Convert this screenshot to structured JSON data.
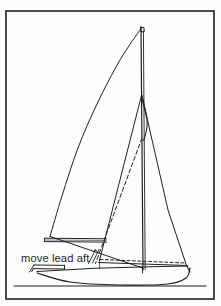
{
  "figure": {
    "kind": "technical-line-drawing",
    "background_color": "#fdfdfb",
    "ink_color": "#231f1d",
    "frame": {
      "label": "figure-border",
      "x": 6,
      "y": 11,
      "width": 208,
      "height": 288,
      "stroke_width": 1.6
    }
  },
  "annotations": {
    "move_lead_aft": {
      "text": "move lead aft",
      "x": 21,
      "y": 262,
      "font_size": 11.2
    }
  },
  "chart_data": {
    "type": "line",
    "xlabel": "",
    "ylabel": "",
    "xlim": [
      0,
      221
    ],
    "ylim": [
      306,
      0
    ],
    "grid": false,
    "legend": "none",
    "annotations": [
      {
        "text": "move lead aft",
        "x": 21,
        "y": 262
      }
    ],
    "series": [
      {
        "name": "mast",
        "style": "solid",
        "stroke_width": 1.2,
        "points": [
          [
            141.0,
            27.0
          ],
          [
            143.0,
            270.0
          ]
        ]
      },
      {
        "name": "mast-aft-face",
        "style": "solid",
        "stroke_width": 0.9,
        "points": [
          [
            143.4,
            31.0
          ],
          [
            145.2,
            269.5
          ]
        ]
      },
      {
        "name": "masthead-cap",
        "style": "solid",
        "stroke_width": 1.0,
        "points": [
          [
            140.6,
            27.2
          ],
          [
            144.0,
            27.6
          ],
          [
            144.2,
            32.0
          ],
          [
            140.8,
            31.6
          ],
          [
            140.6,
            27.2
          ]
        ]
      },
      {
        "name": "mainsail-leech",
        "style": "curve",
        "stroke_width": 1.0,
        "points": [
          [
            141.0,
            28.5
          ],
          [
            120.0,
            60.0
          ],
          [
            97.0,
            104.0
          ],
          [
            78.0,
            148.0
          ],
          [
            62.0,
            196.0
          ],
          [
            50.0,
            236.5
          ]
        ]
      },
      {
        "name": "mainsail-foot-to-tack",
        "style": "solid",
        "stroke_width": 1.0,
        "points": [
          [
            50.0,
            236.5
          ],
          [
            142.8,
            268.0
          ]
        ]
      },
      {
        "name": "boom-top",
        "style": "solid",
        "stroke_width": 1.0,
        "points": [
          [
            44.5,
            238.2
          ],
          [
            106.5,
            238.8
          ]
        ]
      },
      {
        "name": "boom-bottom",
        "style": "solid",
        "stroke_width": 1.0,
        "points": [
          [
            44.5,
            241.6
          ],
          [
            106.6,
            242.1
          ]
        ]
      },
      {
        "name": "boom-end-cap",
        "style": "solid",
        "stroke_width": 1.0,
        "points": [
          [
            44.5,
            238.2
          ],
          [
            44.5,
            241.6
          ]
        ]
      },
      {
        "name": "boom-shade",
        "style": "solid",
        "stroke_width": 0.6,
        "points": [
          [
            45.6,
            240.0
          ],
          [
            106.0,
            240.5
          ]
        ]
      },
      {
        "name": "jib-luff-forestay",
        "style": "solid",
        "stroke_width": 1.0,
        "points": [
          [
            141.6,
            95.0
          ],
          [
            99.0,
            262.5
          ]
        ]
      },
      {
        "name": "jib-leech",
        "style": "solid",
        "stroke_width": 1.0,
        "points": [
          [
            142.2,
            95.5
          ],
          [
            150.0,
            131.0
          ],
          [
            168.0,
            210.0
          ],
          [
            186.5,
            265.5
          ]
        ]
      },
      {
        "name": "jib-upper-leech-hook",
        "style": "curve",
        "stroke_width": 1.1,
        "points": [
          [
            142.0,
            99.0
          ],
          [
            147.0,
            120.0
          ],
          [
            146.2,
            131.5
          ],
          [
            143.6,
            140.5
          ]
        ]
      },
      {
        "name": "jib-foot",
        "style": "solid",
        "stroke_width": 1.0,
        "points": [
          [
            99.0,
            262.5
          ],
          [
            186.5,
            265.5
          ]
        ]
      },
      {
        "name": "sheet-lead-new-dashed",
        "style": "dashed",
        "stroke_width": 1.0,
        "dash": "3,2.4",
        "points": [
          [
            100.0,
            259.5
          ],
          [
            186.0,
            263.0
          ]
        ]
      },
      {
        "name": "jib-luff-alt-dashed",
        "style": "dashed",
        "stroke_width": 1.0,
        "dash": "4,2.6",
        "points": [
          [
            142.0,
            138.0
          ],
          [
            95.5,
            263.5
          ]
        ]
      },
      {
        "name": "lead-arrow-shaft",
        "style": "solid",
        "stroke_width": 0.9,
        "points": [
          [
            88.5,
            263.5
          ],
          [
            95.5,
            250.0
          ]
        ]
      },
      {
        "name": "lead-arrow-shaft-2",
        "style": "solid",
        "stroke_width": 0.9,
        "points": [
          [
            92.5,
            263.0
          ],
          [
            99.0,
            249.5
          ]
        ]
      },
      {
        "name": "lead-arrow-head-1",
        "style": "solid",
        "stroke_width": 0.9,
        "points": [
          [
            93.4,
            251.6
          ],
          [
            95.6,
            249.7
          ],
          [
            97.4,
            252.0
          ]
        ]
      },
      {
        "name": "deck-sheer-line",
        "style": "solid",
        "stroke_width": 1.1,
        "points": [
          [
            37.0,
            271.5
          ],
          [
            95.0,
            268.2
          ],
          [
            150.0,
            266.8
          ],
          [
            188.0,
            266.0
          ]
        ]
      },
      {
        "name": "hull-bottom-profile",
        "style": "curve",
        "stroke_width": 1.2,
        "points": [
          [
            37.0,
            273.0
          ],
          [
            70.0,
            282.0
          ],
          [
            120.0,
            285.0
          ],
          [
            168.0,
            284.0
          ],
          [
            186.0,
            278.0
          ],
          [
            190.0,
            268.0
          ]
        ]
      },
      {
        "name": "waterline",
        "style": "solid",
        "stroke_width": 1.1,
        "points": [
          [
            14.0,
            286.0
          ],
          [
            206.0,
            286.0
          ]
        ]
      },
      {
        "name": "cabin-roof-top",
        "style": "solid",
        "stroke_width": 1.0,
        "points": [
          [
            34.0,
            265.0
          ],
          [
            64.5,
            265.4
          ]
        ]
      },
      {
        "name": "cabin-roof-bottom",
        "style": "solid",
        "stroke_width": 1.0,
        "points": [
          [
            33.4,
            268.6
          ],
          [
            64.6,
            269.0
          ]
        ]
      },
      {
        "name": "cabin-front-slant",
        "style": "solid",
        "stroke_width": 1.0,
        "points": [
          [
            34.0,
            265.0
          ],
          [
            29.4,
            272.0
          ]
        ]
      },
      {
        "name": "cabin-front-slant-inner",
        "style": "solid",
        "stroke_width": 1.0,
        "points": [
          [
            33.4,
            268.6
          ],
          [
            31.8,
            271.6
          ]
        ]
      },
      {
        "name": "cabin-aft-edge",
        "style": "solid",
        "stroke_width": 1.0,
        "points": [
          [
            64.5,
            265.4
          ],
          [
            64.6,
            269.0
          ]
        ]
      },
      {
        "name": "mast-step-bulkhead",
        "style": "solid",
        "stroke_width": 0.9,
        "points": [
          [
            142.4,
            266.6
          ],
          [
            142.5,
            273.0
          ]
        ]
      },
      {
        "name": "cockpit-detail-line",
        "style": "solid",
        "stroke_width": 0.7,
        "points": [
          [
            99.5,
            263.0
          ],
          [
            99.6,
            268.0
          ]
        ]
      },
      {
        "name": "stern-transom",
        "style": "solid",
        "stroke_width": 1.1,
        "points": [
          [
            186.5,
            265.5
          ],
          [
            190.0,
            272.0
          ]
        ]
      }
    ]
  }
}
